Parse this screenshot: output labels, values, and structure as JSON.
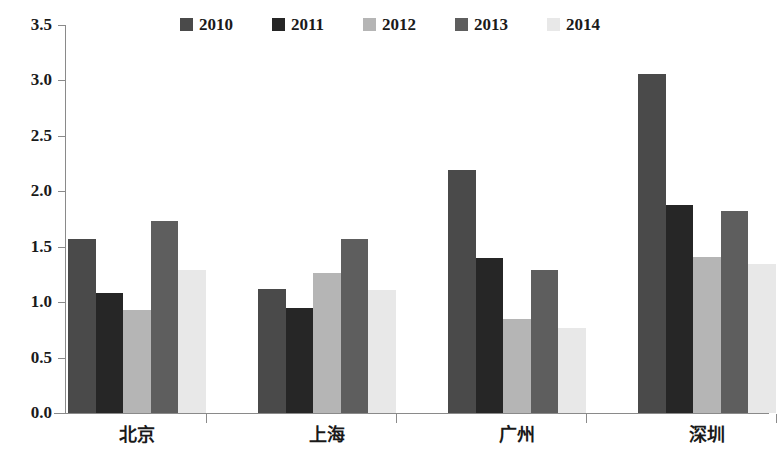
{
  "chart_data": {
    "type": "bar",
    "title": "",
    "subtitle": "",
    "xlabel": "",
    "ylabel": "",
    "categories": [
      "北京",
      "上海",
      "广州",
      "深圳"
    ],
    "series": [
      {
        "name": "2010",
        "color": "#4a4a4a",
        "values": [
          1.57,
          1.12,
          2.19,
          3.06
        ]
      },
      {
        "name": "2011",
        "color": "#262626",
        "values": [
          1.08,
          0.95,
          1.4,
          1.88
        ]
      },
      {
        "name": "2012",
        "color": "#b5b5b5",
        "values": [
          0.93,
          1.26,
          0.85,
          1.41
        ]
      },
      {
        "name": "2013",
        "color": "#5e5e5e",
        "values": [
          1.73,
          1.57,
          1.29,
          1.82
        ]
      },
      {
        "name": "2014",
        "color": "#e8e8e8",
        "values": [
          1.29,
          1.11,
          0.77,
          1.34
        ]
      }
    ],
    "ylim": [
      0.0,
      3.5
    ],
    "ytick_step": 0.5,
    "ytick_labels": [
      "0.0",
      "0.5",
      "1.0",
      "1.5",
      "2.0",
      "2.5",
      "3.0",
      "3.5"
    ],
    "grid": false,
    "legend_position": "top-center",
    "axis_color": "#8a8a8a"
  },
  "legend": {
    "items": [
      {
        "label": "2010",
        "color": "#4a4a4a"
      },
      {
        "label": "2011",
        "color": "#262626"
      },
      {
        "label": "2012",
        "color": "#b5b5b5"
      },
      {
        "label": "2013",
        "color": "#5e5e5e"
      },
      {
        "label": "2014",
        "color": "#e8e8e8"
      }
    ]
  }
}
